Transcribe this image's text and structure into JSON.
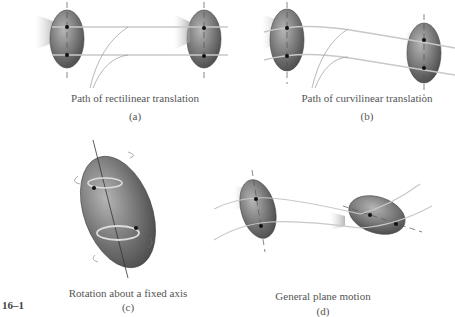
{
  "figure": {
    "number": "16–1",
    "panels": [
      {
        "id": "a",
        "caption": "Path of rectilinear translation",
        "label": "(a)"
      },
      {
        "id": "b",
        "caption": "Path of curvilinear translation",
        "label": "(b)"
      },
      {
        "id": "c",
        "caption": "Rotation about a fixed axis",
        "label": "(c)"
      },
      {
        "id": "d",
        "caption": "General plane motion",
        "label": "(d)"
      }
    ]
  },
  "colors": {
    "body_fill_dark": "#5a5a5a",
    "body_fill_light": "#9a9a9a",
    "path_line": "#b0b0b0",
    "point": "#111111",
    "text": "#555555"
  }
}
